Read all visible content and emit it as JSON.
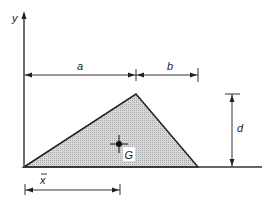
{
  "diagram": {
    "axis": {
      "y_label": "y"
    },
    "dimensions": {
      "a": "a",
      "b": "b",
      "d": "d",
      "xbar": "x"
    },
    "centroid_label": "G",
    "colors": {
      "line": "#222222",
      "fill": "#c8c8c8",
      "background": "#ffffff"
    }
  }
}
